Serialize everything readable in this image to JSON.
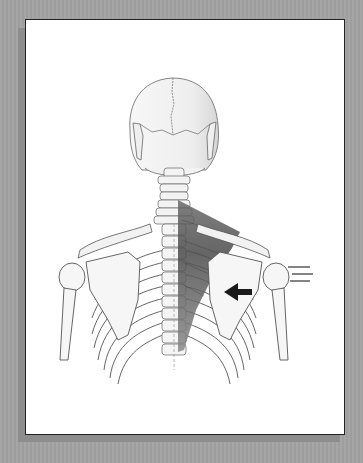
{
  "figure": {
    "highlighted_muscle_color": "#4a4a4a",
    "arrow": {
      "direction": "left",
      "color": "#1a1a1a"
    },
    "motion_lines": {
      "count": 3,
      "color": "#333333"
    }
  },
  "colors": {
    "background": "#a3a3a3",
    "card": "#ffffff",
    "border": "#222222",
    "bone_fill": "#f4f4f4",
    "bone_stroke": "#555555"
  }
}
